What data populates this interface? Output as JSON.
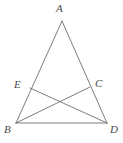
{
  "figure": {
    "background_color": "#ffffff",
    "line_color": "#6e6e6e",
    "label_color": "#4a4a4a",
    "width": 123,
    "height": 143,
    "points": {
      "A": {
        "label": "A",
        "x": 62,
        "y": 21
      },
      "B": {
        "label": "B",
        "x": 16,
        "y": 123
      },
      "D": {
        "label": "D",
        "x": 107,
        "y": 123
      },
      "E": {
        "label": "E",
        "x": 30,
        "y": 88
      },
      "C": {
        "label": "C",
        "x": 90,
        "y": 87
      },
      "X": {
        "label": "",
        "x": 60,
        "y": 104
      }
    },
    "segments": [
      {
        "name": "AB",
        "from": "A",
        "to": "B"
      },
      {
        "name": "AD",
        "from": "A",
        "to": "D"
      },
      {
        "name": "BD",
        "from": "B",
        "to": "D"
      },
      {
        "name": "ED",
        "from": "E",
        "to": "D"
      },
      {
        "name": "CB",
        "from": "C",
        "to": "B"
      }
    ]
  }
}
